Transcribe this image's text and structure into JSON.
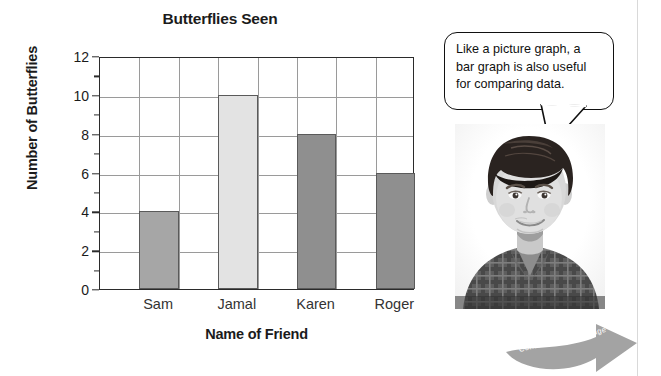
{
  "chart_data": {
    "type": "bar",
    "title": "Butterflies Seen",
    "xlabel": "Name of Friend",
    "ylabel": "Number of Butterflies",
    "categories": [
      "Sam",
      "Jamal",
      "Karen",
      "Roger"
    ],
    "values": [
      4,
      10,
      8,
      6
    ],
    "bar_colors": [
      "#a6a6a6",
      "#e3e3e3",
      "#8f8f8f",
      "#8f8f8f"
    ],
    "ylim": [
      0,
      12
    ],
    "ytick_labels": [
      "0",
      "2",
      "4",
      "6",
      "8",
      "10",
      "12"
    ],
    "ytick_values": [
      0,
      2,
      4,
      6,
      8,
      10,
      12
    ],
    "yminor_values": [
      1,
      3,
      5,
      7,
      9,
      11
    ],
    "grid": true,
    "legend": "none"
  },
  "callout": {
    "speaker": "boy-photo",
    "line1": "Like a picture graph, a",
    "line2": "bar graph is also useful",
    "line3": "for comparing data."
  },
  "footer": {
    "continued_label": "Continued on next page",
    "arrow_color": "#a3a3a3"
  }
}
